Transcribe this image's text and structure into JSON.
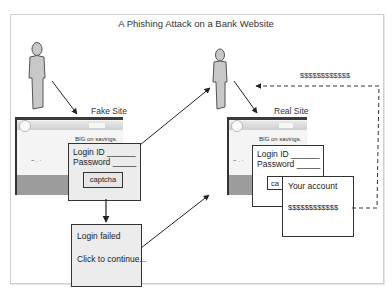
{
  "diagram": {
    "title": "A Phishing Attack on a Bank Website",
    "fake_site": {
      "label": "Fake Site",
      "promo": "BIG on savings.",
      "scribble": "~ . ·",
      "login": {
        "login_id": "Login ID ______",
        "password": "Password _____",
        "captcha": "captcha"
      },
      "failed": {
        "line1": "Login failed",
        "line2": "Click to continue..."
      }
    },
    "real_site": {
      "label": "Real Site",
      "promo": "BIG on savings.",
      "scribble": "~ . ·",
      "login": {
        "login_id": "Login ID ______",
        "password": "Password _____",
        "captcha": "ca"
      },
      "account": {
        "title": "Your account",
        "amount": "$$$$$$$$$$$$"
      }
    },
    "money_flow_label": "$$$$$$$$$$$$",
    "colors": {
      "figure_fill": "#c8c8c8",
      "figure_stroke": "#555555",
      "box_fill": "#ececec",
      "line": "#333333",
      "frame": "#cfcfcf"
    }
  }
}
